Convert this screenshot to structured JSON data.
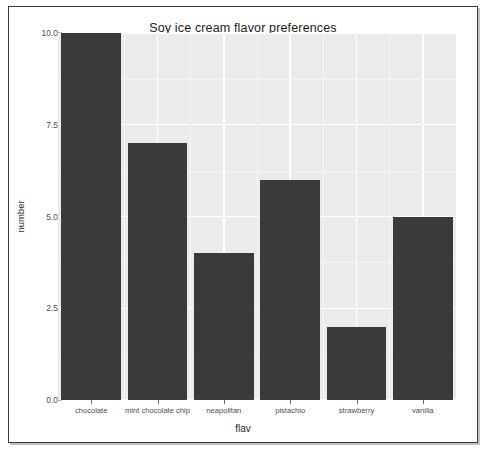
{
  "chart_data": {
    "type": "bar",
    "title": "Soy ice cream flavor preferences",
    "xlabel": "flav",
    "ylabel": "number",
    "categories": [
      "chocolate",
      "mint chocolate chip",
      "neapolitan",
      "pistachio",
      "strawberry",
      "vanilla"
    ],
    "values": [
      10,
      7,
      4,
      6,
      2,
      5
    ],
    "ylim": [
      0,
      10
    ],
    "y_ticks": [
      0.0,
      2.5,
      5.0,
      7.5,
      10.0
    ],
    "y_tick_labels": [
      "0.0",
      "2.5",
      "5.0",
      "7.5",
      "10.0"
    ],
    "y_minor_ticks": [
      1.25,
      3.75,
      6.25,
      8.75
    ],
    "grid": true,
    "legend": false,
    "legend_position": "none",
    "bar_color": "#3a3a3a",
    "panel_background": "#ebebeb",
    "gridline_color": "#ffffff",
    "bar_width_fraction": 0.9
  },
  "figure": {
    "page_background": "#ffffff",
    "border_color": "#3c3c3c"
  }
}
